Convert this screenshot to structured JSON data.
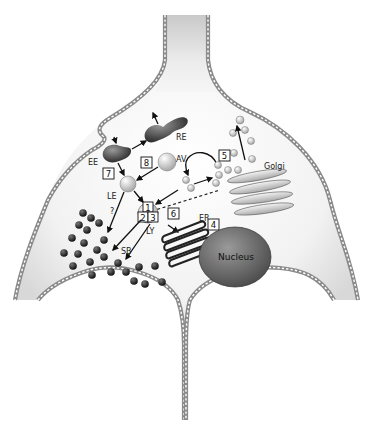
{
  "diagram": {
    "type": "cell-schematic",
    "labels": {
      "re": "RE",
      "ee": "EE",
      "le": "LE",
      "av": "AV",
      "ly": "LY",
      "sb": "SB",
      "er": "ER",
      "golgi": "Golgi",
      "nucleus": "Nucleus",
      "question": "?"
    },
    "pathway_boxes": {
      "b1": "1",
      "b2": "2",
      "b3": "3",
      "b4": "4",
      "b5": "5",
      "b6": "6",
      "b7": "7",
      "b8": "8"
    },
    "colors": {
      "membrane": "#8a8a8a",
      "cytoplasm": "#e6e6e6",
      "organelle_dark": "#4a4a4a",
      "nucleus": "#6e6e6e",
      "background": "#ffffff"
    }
  }
}
